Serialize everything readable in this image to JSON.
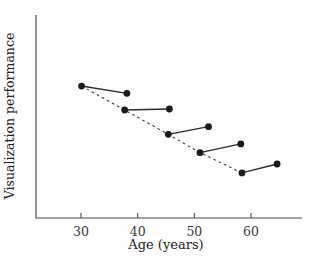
{
  "figure": {
    "xlabel": "Age (years)",
    "ylabel": "Visualization performance"
  },
  "chart_data": {
    "type": "scatter",
    "title": "",
    "xlabel": "Age (years)",
    "ylabel": "Visualization performance",
    "x_ticks": [
      30,
      40,
      50,
      60
    ],
    "xlim": [
      22,
      69
    ],
    "ylim": [
      0,
      100
    ],
    "y_axis_ticks": "none (performance axis unlabeled)",
    "grid": false,
    "legend_position": "none",
    "series": [
      {
        "name": "cohort-1-longitudinal",
        "line_style": "solid",
        "x": [
          30.1,
          38.1
        ],
        "y": [
          65.0,
          61.4
        ]
      },
      {
        "name": "cohort-2-longitudinal",
        "line_style": "solid",
        "x": [
          37.7,
          45.6
        ],
        "y": [
          53.2,
          53.7
        ]
      },
      {
        "name": "cohort-3-longitudinal",
        "line_style": "solid",
        "x": [
          45.4,
          52.5
        ],
        "y": [
          41.2,
          45.0
        ]
      },
      {
        "name": "cohort-4-longitudinal",
        "line_style": "solid",
        "x": [
          51.0,
          58.2
        ],
        "y": [
          32.2,
          36.5
        ]
      },
      {
        "name": "cohort-5-longitudinal",
        "line_style": "solid",
        "x": [
          58.4,
          64.6
        ],
        "y": [
          22.2,
          26.6
        ]
      }
    ],
    "dashed_trend": {
      "name": "cross-sectional-trend",
      "line_style": "dashed",
      "x": [
        30.1,
        37.7,
        45.4,
        51.0,
        58.4
      ],
      "y": [
        65.0,
        53.2,
        41.2,
        32.2,
        22.2
      ]
    },
    "colors": {
      "point": "#1b1b1b",
      "solid_line": "#2b2b2b",
      "dashed_line": "#3d3d3d",
      "axis": "#4a4a4a",
      "tick_label": "#3a3a3a"
    }
  }
}
